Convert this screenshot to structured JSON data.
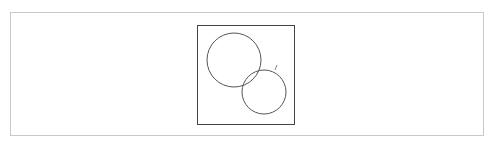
{
  "diagram": {
    "type": "venn",
    "frame": {
      "x": 197,
      "y": 25,
      "width": 98,
      "height": 100,
      "stroke": "#444444"
    },
    "circles": [
      {
        "name": "circle-a",
        "cx": 234,
        "cy": 60,
        "r": 27,
        "stroke": "#555555"
      },
      {
        "name": "circle-b",
        "cx": 264,
        "cy": 92,
        "r": 22,
        "stroke": "#555555"
      }
    ],
    "tick": {
      "x1": 275,
      "y1": 70,
      "x2": 277,
      "y2": 65,
      "stroke": "#888888"
    }
  }
}
